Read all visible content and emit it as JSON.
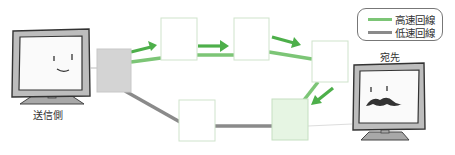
{
  "diagram": {
    "sender_label": "送信側",
    "destination_label": "宛先",
    "legend": {
      "items": [
        {
          "label": "高速回線",
          "color": "#7cc576"
        },
        {
          "label": "低速回線",
          "color": "#8a8a8a"
        }
      ]
    },
    "colors": {
      "high_speed": "#7cc576",
      "arrow": "#4daf4a",
      "low_speed": "#8a8a8a",
      "sender_router_fill": "#d4d4d4",
      "router_border": "#cfe3cc",
      "active_router_fill": "#e6f5e3"
    },
    "nodes": [
      {
        "id": "sender-router",
        "type": "router"
      },
      {
        "id": "router-1",
        "type": "router"
      },
      {
        "id": "router-2",
        "type": "router"
      },
      {
        "id": "router-3",
        "type": "router"
      },
      {
        "id": "router-4",
        "type": "router"
      },
      {
        "id": "router-5",
        "type": "router"
      }
    ]
  }
}
